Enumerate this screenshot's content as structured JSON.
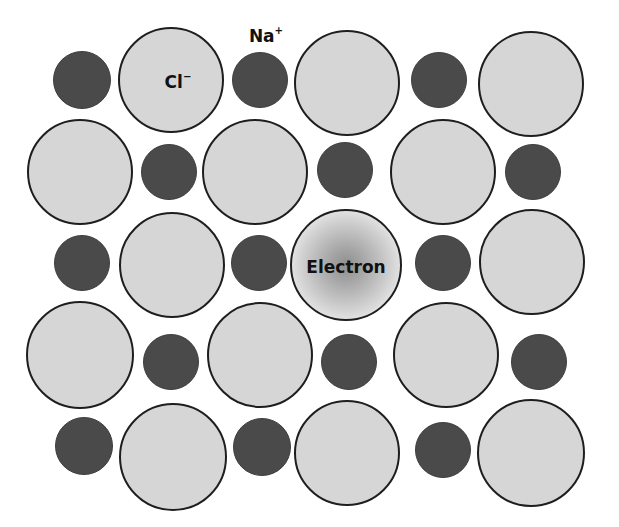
{
  "diagram": {
    "colors": {
      "cation_fill": "#4a4a4a",
      "anion_fill": "#d6d6d6",
      "anion_outline": "#1e1e1e",
      "electron_center": "#8e8e8e",
      "background": "#ffffff"
    },
    "labels": {
      "anion": {
        "text": "Cl",
        "charge": "−",
        "x": 178,
        "y": 82
      },
      "cation": {
        "text": "Na",
        "charge": "+",
        "x": 266,
        "y": 36
      },
      "electron": {
        "text": "Electron",
        "x": 346,
        "y": 267
      }
    },
    "ions": [
      {
        "type": "small",
        "name": "na-ion",
        "x": 82,
        "y": 80,
        "r": 29
      },
      {
        "type": "large",
        "name": "cl-ion",
        "x": 171,
        "y": 80,
        "r": 53
      },
      {
        "type": "small",
        "name": "na-ion",
        "x": 260,
        "y": 80,
        "r": 28
      },
      {
        "type": "large",
        "name": "cl-ion",
        "x": 347,
        "y": 83,
        "r": 53
      },
      {
        "type": "small",
        "name": "na-ion",
        "x": 439,
        "y": 80,
        "r": 28
      },
      {
        "type": "large",
        "name": "cl-ion",
        "x": 531,
        "y": 84,
        "r": 53
      },
      {
        "type": "large",
        "name": "cl-ion",
        "x": 80,
        "y": 172,
        "r": 53
      },
      {
        "type": "small",
        "name": "na-ion",
        "x": 169,
        "y": 172,
        "r": 28
      },
      {
        "type": "large",
        "name": "cl-ion",
        "x": 255,
        "y": 172,
        "r": 53
      },
      {
        "type": "small",
        "name": "na-ion",
        "x": 345,
        "y": 170,
        "r": 28
      },
      {
        "type": "large",
        "name": "cl-ion",
        "x": 443,
        "y": 172,
        "r": 53
      },
      {
        "type": "small",
        "name": "na-ion",
        "x": 533,
        "y": 172,
        "r": 28
      },
      {
        "type": "small",
        "name": "na-ion",
        "x": 82,
        "y": 263,
        "r": 28
      },
      {
        "type": "large",
        "name": "cl-ion",
        "x": 172,
        "y": 265,
        "r": 53
      },
      {
        "type": "small",
        "name": "na-ion",
        "x": 259,
        "y": 263,
        "r": 28
      },
      {
        "type": "electron",
        "name": "electron-vacancy",
        "x": 346,
        "y": 265,
        "r": 56
      },
      {
        "type": "small",
        "name": "na-ion",
        "x": 443,
        "y": 263,
        "r": 28
      },
      {
        "type": "large",
        "name": "cl-ion",
        "x": 532,
        "y": 262,
        "r": 53
      },
      {
        "type": "large",
        "name": "cl-ion",
        "x": 80,
        "y": 355,
        "r": 54
      },
      {
        "type": "small",
        "name": "na-ion",
        "x": 171,
        "y": 362,
        "r": 28
      },
      {
        "type": "large",
        "name": "cl-ion",
        "x": 260,
        "y": 355,
        "r": 53
      },
      {
        "type": "small",
        "name": "na-ion",
        "x": 349,
        "y": 362,
        "r": 28
      },
      {
        "type": "large",
        "name": "cl-ion",
        "x": 446,
        "y": 355,
        "r": 53
      },
      {
        "type": "small",
        "name": "na-ion",
        "x": 539,
        "y": 362,
        "r": 28
      },
      {
        "type": "small",
        "name": "na-ion",
        "x": 84,
        "y": 446,
        "r": 29
      },
      {
        "type": "large",
        "name": "cl-ion",
        "x": 173,
        "y": 457,
        "r": 54
      },
      {
        "type": "small",
        "name": "na-ion",
        "x": 262,
        "y": 447,
        "r": 29
      },
      {
        "type": "large",
        "name": "cl-ion",
        "x": 347,
        "y": 453,
        "r": 53
      },
      {
        "type": "small",
        "name": "na-ion",
        "x": 443,
        "y": 450,
        "r": 28
      },
      {
        "type": "large",
        "name": "cl-ion",
        "x": 531,
        "y": 453,
        "r": 54
      }
    ]
  }
}
